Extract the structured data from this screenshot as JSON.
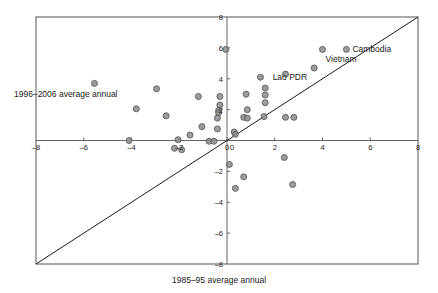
{
  "chart_data": {
    "type": "scatter",
    "title": "",
    "subtitle": "",
    "xlabel": "1985–95 average annual",
    "ylabel": "1996–2006 average annual",
    "xlim": [
      -8,
      8
    ],
    "ylim": [
      -8,
      8
    ],
    "grid": false,
    "legend": null,
    "x_ticks": [
      -8,
      -6,
      -4,
      -2,
      0,
      2,
      4,
      6,
      8
    ],
    "y_ticks": [
      -8,
      -6,
      -4,
      -2,
      0,
      2,
      4,
      6,
      8
    ],
    "x_tick_labels": [
      "–8",
      "–6",
      "–4",
      "–2",
      "0",
      "2",
      "4",
      "6",
      "8"
    ],
    "y_tick_labels": [
      "–8",
      "–6",
      "–4",
      "–2",
      "0",
      "2",
      "4",
      "6",
      "8"
    ],
    "reference_line": {
      "name": "45-degree-line",
      "type": "identity",
      "from": [
        -8,
        -8
      ],
      "to": [
        8,
        8
      ]
    },
    "marker": {
      "shape": "circle",
      "fill": "#8c8c8c",
      "edge": "#5a5a5a",
      "size_px": 6
    },
    "points": [
      {
        "x": 5.0,
        "y": 5.9,
        "label": "Cambodia"
      },
      {
        "x": 4.0,
        "y": 5.9,
        "label": "Vietnam"
      },
      {
        "x": 3.65,
        "y": 4.7,
        "label": ""
      },
      {
        "x": 2.45,
        "y": 4.3,
        "label": ""
      },
      {
        "x": 1.4,
        "y": 4.1,
        "label": ""
      },
      {
        "x": 1.6,
        "y": 3.4,
        "label": ""
      },
      {
        "x": 0.8,
        "y": 3.0,
        "label": ""
      },
      {
        "x": 1.6,
        "y": 2.95,
        "label": ""
      },
      {
        "x": 1.6,
        "y": 2.45,
        "label": ""
      },
      {
        "x": 0.85,
        "y": 2.0,
        "label": ""
      },
      {
        "x": 1.55,
        "y": 1.55,
        "label": ""
      },
      {
        "x": 0.7,
        "y": 1.5,
        "label": ""
      },
      {
        "x": 0.85,
        "y": 1.45,
        "label": ""
      },
      {
        "x": 2.45,
        "y": 1.5,
        "label": ""
      },
      {
        "x": 2.8,
        "y": 1.5,
        "label": ""
      },
      {
        "x": 0.3,
        "y": 0.55,
        "label": ""
      },
      {
        "x": 0.35,
        "y": 0.4,
        "label": ""
      },
      {
        "x": -0.3,
        "y": 2.85,
        "label": ""
      },
      {
        "x": -0.3,
        "y": 2.3,
        "label": ""
      },
      {
        "x": -0.35,
        "y": 1.95,
        "label": ""
      },
      {
        "x": -0.35,
        "y": 1.8,
        "label": ""
      },
      {
        "x": -0.4,
        "y": 1.45,
        "label": ""
      },
      {
        "x": -0.4,
        "y": 0.75,
        "label": ""
      },
      {
        "x": -1.05,
        "y": 0.9,
        "label": ""
      },
      {
        "x": -1.2,
        "y": 2.85,
        "label": ""
      },
      {
        "x": -1.55,
        "y": 0.35,
        "label": ""
      },
      {
        "x": -2.05,
        "y": 0.05,
        "label": ""
      },
      {
        "x": -2.2,
        "y": -0.5,
        "label": ""
      },
      {
        "x": -1.9,
        "y": -0.6,
        "label": ""
      },
      {
        "x": -0.75,
        "y": -0.05,
        "label": ""
      },
      {
        "x": -0.55,
        "y": -0.05,
        "label": ""
      },
      {
        "x": -2.55,
        "y": 1.6,
        "label": ""
      },
      {
        "x": -2.95,
        "y": 3.35,
        "label": ""
      },
      {
        "x": -3.8,
        "y": 2.05,
        "label": ""
      },
      {
        "x": -5.55,
        "y": 3.7,
        "label": ""
      },
      {
        "x": -4.1,
        "y": 0.0,
        "label": ""
      },
      {
        "x": -0.05,
        "y": 5.9,
        "label": ""
      },
      {
        "x": 0.1,
        "y": -1.55,
        "label": ""
      },
      {
        "x": 0.7,
        "y": -2.35,
        "label": ""
      },
      {
        "x": 0.35,
        "y": -3.1,
        "label": ""
      },
      {
        "x": 2.4,
        "y": -1.1,
        "label": ""
      },
      {
        "x": 2.75,
        "y": -2.85,
        "label": ""
      }
    ],
    "annotations": [
      {
        "text": "Cambodia",
        "x": 5.0,
        "y": 5.9,
        "anchor": "left"
      },
      {
        "text": "Vietnam",
        "x": 4.0,
        "y": 5.9,
        "anchor": "below-right"
      },
      {
        "text": "Lao PDR",
        "x": 3.65,
        "y": 4.7,
        "anchor": "below-left"
      }
    ]
  }
}
